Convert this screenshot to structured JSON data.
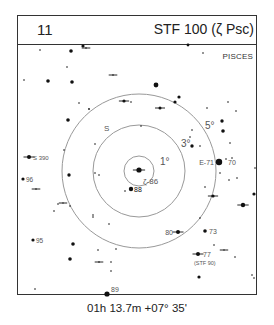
{
  "header": {
    "chart_number": "11",
    "title": "STF 100 (ζ Psc)"
  },
  "constellation": "PISCES",
  "footer": {
    "coordinates": "01h 13.7m  +07° 35'"
  },
  "field_circles": [
    {
      "label": "1°",
      "radius_deg": 1
    },
    {
      "label": "3°",
      "radius_deg": 3
    },
    {
      "label": "5°",
      "radius_deg": 5
    }
  ],
  "colors": {
    "ink": "#111111",
    "circle": "#999999",
    "label": "#555555"
  },
  "labels": {
    "center": "ζ-86",
    "star_88": "88",
    "star_e71": "E-71",
    "star_70": "70",
    "star_s390": "S 390",
    "star_96": "96",
    "star_95": "95",
    "star_80": "80",
    "star_73": "73",
    "star_77": "77",
    "star_77_sub": "(STF 90)",
    "star_89": "89",
    "south_marker": "S"
  }
}
